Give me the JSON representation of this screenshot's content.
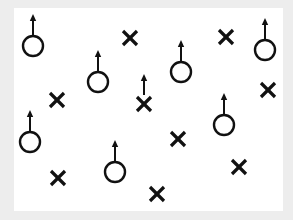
{
  "diagram": {
    "background": "#ededed",
    "panel_color": "#ffffff",
    "stroke_color": "#111111",
    "legend": {
      "circle_with_arrow": "player (O) with upward movement arrow",
      "x": "player (X)",
      "x_with_arrow": "player (X) with upward movement arrow"
    },
    "markers": [
      {
        "type": "circle",
        "x": 33,
        "y": 46,
        "arrow": true
      },
      {
        "type": "x",
        "x": 130,
        "y": 38,
        "arrow": false
      },
      {
        "type": "x",
        "x": 226,
        "y": 37,
        "arrow": false
      },
      {
        "type": "circle",
        "x": 265,
        "y": 50,
        "arrow": true
      },
      {
        "type": "circle",
        "x": 98,
        "y": 82,
        "arrow": true
      },
      {
        "type": "circle",
        "x": 181,
        "y": 72,
        "arrow": true
      },
      {
        "type": "x",
        "x": 57,
        "y": 100,
        "arrow": false
      },
      {
        "type": "x",
        "x": 144,
        "y": 104,
        "arrow": true
      },
      {
        "type": "x",
        "x": 268,
        "y": 90,
        "arrow": false
      },
      {
        "type": "circle",
        "x": 224,
        "y": 125,
        "arrow": true
      },
      {
        "type": "circle",
        "x": 30,
        "y": 142,
        "arrow": true
      },
      {
        "type": "x",
        "x": 178,
        "y": 139,
        "arrow": false
      },
      {
        "type": "circle",
        "x": 115,
        "y": 172,
        "arrow": true
      },
      {
        "type": "x",
        "x": 239,
        "y": 167,
        "arrow": false
      },
      {
        "type": "x",
        "x": 58,
        "y": 178,
        "arrow": false
      },
      {
        "type": "x",
        "x": 157,
        "y": 194,
        "arrow": false
      }
    ],
    "counts": {
      "circles": 7,
      "xs": 9,
      "arrows": 8
    }
  }
}
